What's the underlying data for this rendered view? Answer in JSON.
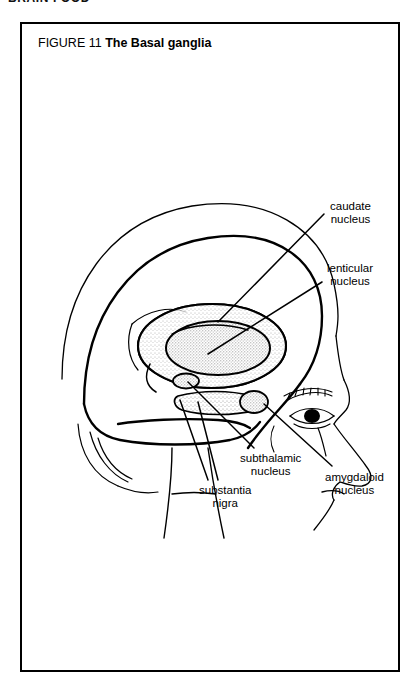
{
  "page": {
    "running_header": "BRAIN FOOD"
  },
  "figure": {
    "number_label": "FIGURE 11",
    "title": "The Basal ganglia",
    "border_color": "#000000",
    "ink_color": "#000000",
    "stipple_color": "#9a9a9a"
  },
  "labels": {
    "caudate": {
      "line1": "caudate",
      "line2": "nucleus"
    },
    "lenticular": {
      "line1": "lenticular",
      "line2": "nucleus"
    },
    "subthalamic": {
      "line1": "subthalamic",
      "line2": "nucleus"
    },
    "substantia": {
      "line1": "substantia",
      "line2": "nigra"
    },
    "amygdaloid": {
      "line1": "amygdaloid",
      "line2": "nucleus"
    }
  }
}
